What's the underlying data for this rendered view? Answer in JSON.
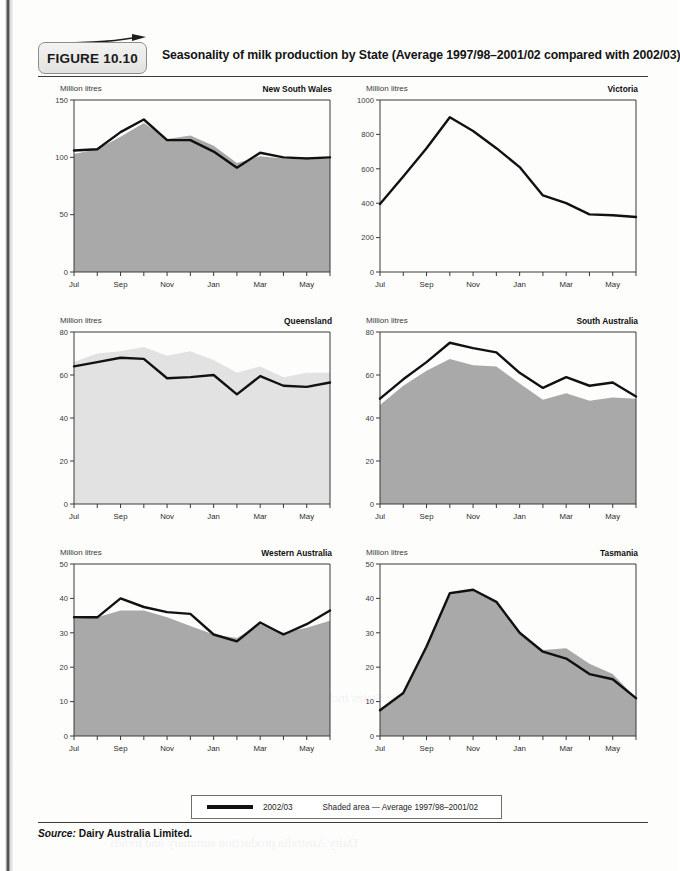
{
  "figure": {
    "label": "FIGURE 10.10",
    "title": "Seasonality of milk production by State (Average 1997/98–2001/02 compared with 2002/03)"
  },
  "legend": {
    "line_label": "2002/03",
    "area_label": "Shaded area — Average 1997/98–2001/02"
  },
  "source": {
    "prefix": "Source:",
    "text": "Dairy Australia Limited."
  },
  "common": {
    "unit_label": "Million litres",
    "months": [
      "Jul",
      "Aug",
      "Sep",
      "Oct",
      "Nov",
      "Dec",
      "Jan",
      "Feb",
      "Mar",
      "Apr",
      "May",
      "Jun"
    ],
    "tick_labels": [
      "Jul",
      "",
      "Sep",
      "",
      "Nov",
      "",
      "Jan",
      "",
      "Mar",
      "",
      "May",
      ""
    ],
    "line_color": "#111111",
    "area_color_dark": "#a9a9a9",
    "area_color_light": "#e2e2e2",
    "axis_color": "#2b2b2b"
  },
  "chart_data": [
    {
      "type": "area",
      "title": "New South Wales",
      "xlabel": "",
      "ylabel": "Million litres",
      "categories": [
        "Jul",
        "Aug",
        "Sep",
        "Oct",
        "Nov",
        "Dec",
        "Jan",
        "Feb",
        "Mar",
        "Apr",
        "May",
        "Jun"
      ],
      "ylim": [
        0,
        150
      ],
      "yticks": [
        0,
        50,
        100,
        150
      ],
      "grid": false,
      "legend_position": "figure-bottom",
      "area_fill": "#a9a9a9",
      "series": [
        {
          "name": "Average 1997/98–2001/02",
          "kind": "area",
          "values": [
            103,
            107,
            118,
            130,
            116,
            119,
            110,
            95,
            101,
            99,
            98,
            99
          ]
        },
        {
          "name": "2002/03",
          "kind": "line",
          "values": [
            106,
            107,
            122,
            133,
            115,
            115,
            105,
            91,
            104,
            100,
            99,
            100
          ]
        }
      ]
    },
    {
      "type": "area",
      "title": "Victoria",
      "xlabel": "",
      "ylabel": "Million litres",
      "categories": [
        "Jul",
        "Aug",
        "Sep",
        "Oct",
        "Nov",
        "Dec",
        "Jan",
        "Feb",
        "Mar",
        "Apr",
        "May",
        "Jun"
      ],
      "ylim": [
        0,
        1000
      ],
      "yticks": [
        0,
        200,
        400,
        600,
        800,
        1000
      ],
      "grid": false,
      "legend_position": "figure-bottom",
      "area_fill": "#ffffff",
      "series": [
        {
          "name": "Average 1997/98–2001/02",
          "kind": "area",
          "values": [
            0,
            0,
            0,
            0,
            0,
            0,
            0,
            0,
            0,
            0,
            0,
            0
          ]
        },
        {
          "name": "2002/03",
          "kind": "line",
          "values": [
            395,
            555,
            720,
            900,
            820,
            720,
            610,
            445,
            400,
            335,
            330,
            320
          ]
        }
      ]
    },
    {
      "type": "area",
      "title": "Queensland",
      "xlabel": "",
      "ylabel": "Million litres",
      "categories": [
        "Jul",
        "Aug",
        "Sep",
        "Oct",
        "Nov",
        "Dec",
        "Jan",
        "Feb",
        "Mar",
        "Apr",
        "May",
        "Jun"
      ],
      "ylim": [
        0,
        80
      ],
      "yticks": [
        0,
        20,
        40,
        60,
        80
      ],
      "grid": false,
      "legend_position": "figure-bottom",
      "area_fill": "#e2e2e2",
      "series": [
        {
          "name": "Average 1997/98–2001/02",
          "kind": "area",
          "values": [
            66,
            70,
            71,
            73,
            69,
            71,
            67,
            61,
            64,
            59,
            61,
            61
          ]
        },
        {
          "name": "2002/03",
          "kind": "line",
          "values": [
            64,
            66,
            68,
            67.5,
            58.5,
            59,
            60,
            51,
            59.5,
            55,
            54.5,
            56.5
          ]
        }
      ]
    },
    {
      "type": "area",
      "title": "South Australia",
      "xlabel": "",
      "ylabel": "Million litres",
      "categories": [
        "Jul",
        "Aug",
        "Sep",
        "Oct",
        "Nov",
        "Dec",
        "Jan",
        "Feb",
        "Mar",
        "Apr",
        "May",
        "Jun"
      ],
      "ylim": [
        0,
        80
      ],
      "yticks": [
        0,
        20,
        40,
        60,
        80
      ],
      "grid": false,
      "legend_position": "figure-bottom",
      "area_fill": "#a9a9a9",
      "series": [
        {
          "name": "Average 1997/98–2001/02",
          "kind": "area",
          "values": [
            46,
            55,
            62,
            67.5,
            64.5,
            64,
            56,
            48.5,
            51.5,
            48,
            49.5,
            49
          ]
        },
        {
          "name": "2002/03",
          "kind": "line",
          "values": [
            49,
            58,
            66,
            75,
            72.5,
            70.5,
            61,
            54,
            59,
            55,
            56.5,
            50
          ]
        }
      ]
    },
    {
      "type": "area",
      "title": "Western Australia",
      "xlabel": "",
      "ylabel": "Million litres",
      "categories": [
        "Jul",
        "Aug",
        "Sep",
        "Oct",
        "Nov",
        "Dec",
        "Jan",
        "Feb",
        "Mar",
        "Apr",
        "May",
        "Jun"
      ],
      "ylim": [
        0,
        50
      ],
      "yticks": [
        0,
        10,
        20,
        30,
        40,
        50
      ],
      "grid": false,
      "legend_position": "figure-bottom",
      "area_fill": "#a9a9a9",
      "series": [
        {
          "name": "Average 1997/98–2001/02",
          "kind": "area",
          "values": [
            34,
            34.5,
            36.5,
            36.5,
            34.5,
            32,
            29.5,
            28.5,
            32.5,
            30,
            31.5,
            33.5
          ]
        },
        {
          "name": "2002/03",
          "kind": "line",
          "values": [
            34.5,
            34.5,
            40,
            37.5,
            36,
            35.5,
            29.5,
            27.5,
            33,
            29.5,
            32.5,
            36.5
          ]
        }
      ]
    },
    {
      "type": "area",
      "title": "Tasmania",
      "xlabel": "",
      "ylabel": "Million litres",
      "categories": [
        "Jul",
        "Aug",
        "Sep",
        "Oct",
        "Nov",
        "Dec",
        "Jan",
        "Feb",
        "Mar",
        "Apr",
        "May",
        "Jun"
      ],
      "ylim": [
        0,
        50
      ],
      "yticks": [
        0,
        10,
        20,
        30,
        40,
        50
      ],
      "grid": false,
      "legend_position": "figure-bottom",
      "area_fill": "#a9a9a9",
      "series": [
        {
          "name": "Average 1997/98–2001/02",
          "kind": "area",
          "values": [
            7.5,
            12.5,
            26,
            41,
            42.5,
            39,
            30,
            25,
            25.5,
            21,
            18,
            11
          ]
        },
        {
          "name": "2002/03",
          "kind": "line",
          "values": [
            7.5,
            12.5,
            26,
            41.5,
            42.5,
            39,
            30,
            24.5,
            22.5,
            18,
            16.5,
            11
          ]
        }
      ]
    }
  ]
}
